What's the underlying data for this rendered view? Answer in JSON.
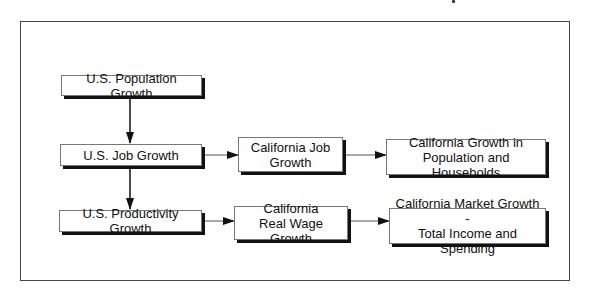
{
  "diagram": {
    "type": "flowchart",
    "nodes": [
      {
        "id": "us_pop",
        "label": "U.S. Population Growth"
      },
      {
        "id": "us_job",
        "label": "U.S. Job Growth"
      },
      {
        "id": "ca_job",
        "line1": "California Job",
        "line2": "Growth"
      },
      {
        "id": "ca_pop_hh",
        "line1": "California Growth in",
        "line2": "Population and Households"
      },
      {
        "id": "us_prod",
        "label": "U.S. Productivity Growth"
      },
      {
        "id": "ca_wage",
        "line1": "California",
        "line2": "Real Wage Growth"
      },
      {
        "id": "ca_market",
        "line1": "California Market Growth -",
        "line2": "Total Income and Spending"
      }
    ],
    "edges": [
      {
        "from": "us_pop",
        "to": "us_job"
      },
      {
        "from": "us_job",
        "to": "us_prod"
      },
      {
        "from": "us_job",
        "to": "ca_job"
      },
      {
        "from": "ca_job",
        "to": "ca_pop_hh"
      },
      {
        "from": "us_prod",
        "to": "ca_wage"
      },
      {
        "from": "ca_wage",
        "to": "ca_market"
      }
    ],
    "colors": {
      "border": "#777777",
      "shadow": "#111111",
      "arrow": "#111111",
      "frame": "#444444"
    }
  }
}
